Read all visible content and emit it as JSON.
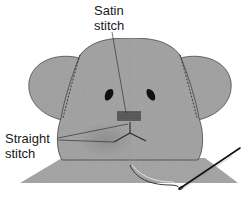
{
  "diagram": {
    "labels": {
      "satin": {
        "line1": "Satin",
        "line2": "stitch"
      },
      "straight": {
        "line1": "Straight",
        "line2": "stitch"
      }
    },
    "colors": {
      "fill": "#a9a9a9",
      "fill_dark": "#8f8f8f",
      "outline": "#3a3a3a",
      "feature": "#111111",
      "needle": "#1a1a1a",
      "background": "#ffffff"
    }
  }
}
